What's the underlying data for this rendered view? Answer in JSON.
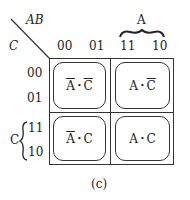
{
  "diagram": {
    "type": "karnaugh-map",
    "corner_row_var": "AB",
    "corner_col_var": "C",
    "column_headers": [
      "00",
      "01",
      "11",
      "10"
    ],
    "column_group": {
      "label": "A",
      "spans": [
        "11",
        "10"
      ]
    },
    "row_headers": [
      "00",
      "01",
      "11",
      "10"
    ],
    "row_group": {
      "label": "C",
      "spans": [
        "11",
        "10"
      ]
    },
    "loops": [
      {
        "pos": "top-left",
        "var1": "A",
        "var1_bar": true,
        "dot": "•",
        "var2": "C",
        "var2_bar": true
      },
      {
        "pos": "top-right",
        "var1": "A",
        "var1_bar": false,
        "dot": "•",
        "var2": "C",
        "var2_bar": true
      },
      {
        "pos": "bottom-left",
        "var1": "A",
        "var1_bar": true,
        "dot": "•",
        "var2": "C",
        "var2_bar": false
      },
      {
        "pos": "bottom-right",
        "var1": "A",
        "var1_bar": false,
        "dot": "•",
        "var2": "C",
        "var2_bar": false
      }
    ],
    "caption": "(c)"
  }
}
